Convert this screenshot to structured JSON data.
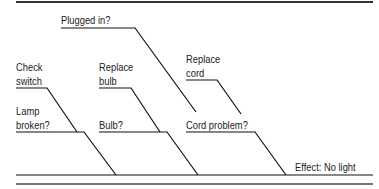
{
  "diagram": {
    "type": "fishbone",
    "effect": "Effect: No light",
    "causes": [
      {
        "label": "Lamp broken?",
        "line1": "Lamp",
        "line2": "broken?",
        "sub": {
          "line1": "Check",
          "line2": "switch"
        }
      },
      {
        "label": "Bulb?",
        "sub": {
          "line1": "Replace",
          "line2": "bulb"
        }
      },
      {
        "label": "Cord problem?",
        "sub": {
          "line1": "Replace",
          "line2": "cord"
        },
        "sub2": {
          "label": "Plugged in?"
        }
      }
    ],
    "colors": {
      "line": "#111111",
      "rule": "#555555",
      "text": "#222222"
    }
  }
}
